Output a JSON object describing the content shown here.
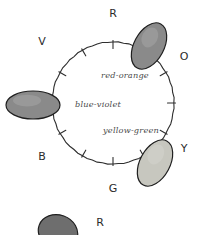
{
  "figure": {
    "background_color": "#ffffff",
    "ink_color": "#2e2e2e",
    "wheel": {
      "center_x": 113,
      "center_y": 103,
      "radius": 61,
      "stroke_color": "#2e2e2e"
    },
    "hue_letters": [
      {
        "id": "R",
        "label": "R",
        "angle_deg": 270,
        "x": 113,
        "y": 17
      },
      {
        "id": "O",
        "label": "O",
        "angle_deg": 330,
        "x": 184,
        "y": 60
      },
      {
        "id": "Y",
        "label": "Y",
        "angle_deg": 30,
        "x": 184,
        "y": 152
      },
      {
        "id": "G",
        "label": "G",
        "angle_deg": 90,
        "x": 113,
        "y": 192
      },
      {
        "id": "B",
        "label": "B",
        "angle_deg": 150,
        "x": 42,
        "y": 160
      },
      {
        "id": "V",
        "label": "V",
        "angle_deg": 210,
        "x": 42,
        "y": 45
      }
    ],
    "tick_angles_deg": [
      240,
      300,
      0,
      60,
      120,
      180
    ],
    "hue_blobs": [
      {
        "name": "red-orange",
        "caption": "red-orange",
        "fill_color": "#8a8a8a",
        "stroke_color": "#1f1f1f",
        "cx": 149,
        "cy": 46,
        "rx": 15,
        "ry": 25,
        "rotation_deg": 28,
        "caption_x": 125,
        "caption_y": 78
      },
      {
        "name": "blue-violet",
        "caption": "blue-violet",
        "fill_color": "#8a8a8a",
        "stroke_color": "#1f1f1f",
        "cx": 33,
        "cy": 105,
        "rx": 27,
        "ry": 14,
        "rotation_deg": 0,
        "caption_x": 98,
        "caption_y": 107
      },
      {
        "name": "yellow-green",
        "caption": "yellow-green",
        "fill_color": "#c7c7bf",
        "stroke_color": "#1f1f1f",
        "cx": 155,
        "cy": 163,
        "rx": 15,
        "ry": 25,
        "rotation_deg": 28,
        "caption_x": 131,
        "caption_y": 133
      }
    ],
    "next_figure_fragment": {
      "name": "cropped-next-diagram",
      "letter": "R",
      "letter_x": 100,
      "letter_y": 226,
      "blob_fill_color": "#6e6e6e",
      "blob_stroke_color": "#1f1f1f",
      "blob_cx": 58,
      "blob_cy": 232,
      "blob_rx": 20,
      "blob_ry": 17,
      "blob_rotation_deg": 20
    }
  }
}
